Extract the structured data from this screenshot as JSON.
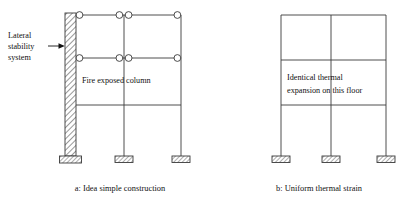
{
  "figure": {
    "background_color": "#ffffff",
    "line_color": "#3a3a3a",
    "text_color": "#111111",
    "hatch_color": "#6b6b6b"
  },
  "panels": [
    {
      "id": "a",
      "caption": "a: Idea simple construction",
      "labels": {
        "lateral_stability": "Lateral\nstability\nsystem",
        "lateral_stability_line1": "Lateral",
        "lateral_stability_line2": "stability",
        "lateral_stability_line3": "system",
        "fire_exposed_column": "Fire exposed column"
      },
      "structure": {
        "columns": 3,
        "beam_levels": 3,
        "has_shear_wall": true,
        "shear_wall_side": "left",
        "pinned_joint_count": 10,
        "footings": 3
      }
    },
    {
      "id": "b",
      "caption": "b: Uniform thermal strain",
      "labels": {
        "identical_thermal_expansion_line1": "Identical thermal",
        "identical_thermal_expansion_line2": "expansion on this floor"
      },
      "structure": {
        "columns": 3,
        "beam_levels": 2,
        "has_shear_wall": false,
        "pinned_joint_count": 0,
        "footings": 3
      }
    }
  ]
}
